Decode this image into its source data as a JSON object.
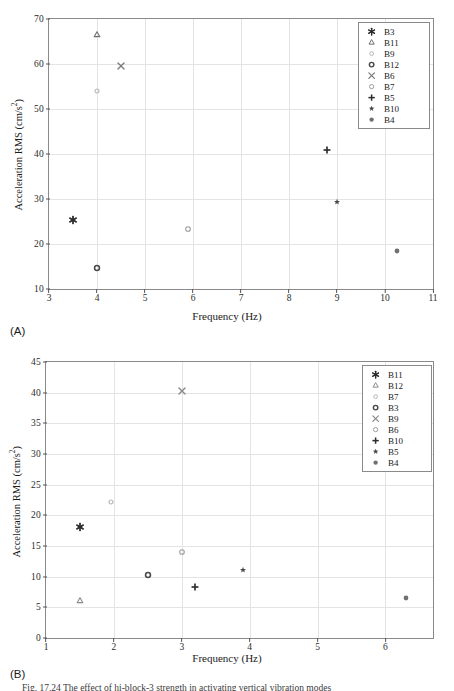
{
  "figure": {
    "caption": "Fig. 17.24 The effect of hi-block-3 strength in activating vertical vibration modes"
  },
  "panels": [
    {
      "tag": "(A)",
      "xlabel": "Frequency (Hz)",
      "ylabel": "Acceleration RMS (cm/s",
      "ylabel_sup": "2",
      "ylabel_close": ")",
      "xticks": [
        3,
        4,
        5,
        6,
        7,
        8,
        9,
        10,
        11
      ],
      "yticks": [
        10,
        20,
        30,
        40,
        50,
        60,
        70
      ],
      "xlim": [
        3,
        11
      ],
      "ylim": [
        10,
        70
      ]
    },
    {
      "tag": "(B)",
      "xlabel": "Frequency (Hz)",
      "ylabel": "Acceleration RMS (cm/s",
      "ylabel_sup": "2",
      "ylabel_close": ")",
      "xticks": [
        1,
        2,
        3,
        4,
        5,
        6
      ],
      "yticks": [
        0,
        5,
        10,
        15,
        20,
        25,
        30,
        35,
        40,
        45
      ],
      "xlim": [
        1,
        6.7
      ],
      "ylim": [
        0,
        45
      ]
    }
  ],
  "chart_data": [
    {
      "type": "scatter",
      "title": "",
      "panel": "(A)",
      "xlabel": "Frequency (Hz)",
      "ylabel": "Acceleration RMS (cm/s^2)",
      "xlim": [
        3,
        11
      ],
      "ylim": [
        10,
        70
      ],
      "xticks": [
        3,
        4,
        5,
        6,
        7,
        8,
        9,
        10,
        11
      ],
      "yticks": [
        10,
        20,
        30,
        40,
        50,
        60,
        70
      ],
      "grid": true,
      "legend_position": "top-right",
      "series": [
        {
          "name": "B3",
          "marker": "asterisk",
          "color": "#2d2d2d",
          "x": 3.5,
          "y": 25.3
        },
        {
          "name": "B11",
          "marker": "triangle",
          "color": "#6e6e6e",
          "x": 4.0,
          "y": 66.5
        },
        {
          "name": "B9",
          "marker": "circle-sm",
          "color": "#b4b4b4",
          "x": 4.0,
          "y": 54.0
        },
        {
          "name": "B12",
          "marker": "circle-bold",
          "color": "#4a4a4a",
          "x": 4.0,
          "y": 14.7
        },
        {
          "name": "B6",
          "marker": "x",
          "color": "#7a7a7a",
          "x": 4.5,
          "y": 59.5
        },
        {
          "name": "B7",
          "marker": "circle",
          "color": "#9b9b9b",
          "x": 5.9,
          "y": 23.4
        },
        {
          "name": "B5",
          "marker": "plus",
          "color": "#2d2d2d",
          "x": 8.8,
          "y": 40.8
        },
        {
          "name": "B10",
          "marker": "pentagram",
          "color": "#4a4a4a",
          "x": 9.0,
          "y": 29.4
        },
        {
          "name": "B4",
          "marker": "circle-filled",
          "color": "#707070",
          "x": 10.25,
          "y": 18.4
        }
      ]
    },
    {
      "type": "scatter",
      "title": "",
      "panel": "(B)",
      "xlabel": "Frequency (Hz)",
      "ylabel": "Acceleration RMS (cm/s^2)",
      "xlim": [
        1,
        6.7
      ],
      "ylim": [
        0,
        45
      ],
      "xticks": [
        1,
        2,
        3,
        4,
        5,
        6
      ],
      "yticks": [
        0,
        5,
        10,
        15,
        20,
        25,
        30,
        35,
        40,
        45
      ],
      "grid": true,
      "legend_position": "top-right",
      "series": [
        {
          "name": "B11",
          "marker": "asterisk",
          "color": "#2d2d2d",
          "x": 1.5,
          "y": 18.1
        },
        {
          "name": "B12",
          "marker": "triangle",
          "color": "#8a8a8a",
          "x": 1.5,
          "y": 6.1
        },
        {
          "name": "B7",
          "marker": "circle-sm",
          "color": "#b4b4b4",
          "x": 1.95,
          "y": 22.2
        },
        {
          "name": "B3",
          "marker": "circle-bold",
          "color": "#4a4a4a",
          "x": 2.5,
          "y": 10.35
        },
        {
          "name": "B9",
          "marker": "x",
          "color": "#8a8a8a",
          "x": 3.0,
          "y": 40.3
        },
        {
          "name": "B6",
          "marker": "circle",
          "color": "#9b9b9b",
          "x": 3.0,
          "y": 14.0
        },
        {
          "name": "B10",
          "marker": "plus",
          "color": "#2d2d2d",
          "x": 3.2,
          "y": 8.25
        },
        {
          "name": "B5",
          "marker": "pentagram",
          "color": "#4a4a4a",
          "x": 3.9,
          "y": 11.1
        },
        {
          "name": "B4",
          "marker": "circle-filled",
          "color": "#707070",
          "x": 6.3,
          "y": 6.5
        }
      ]
    }
  ]
}
